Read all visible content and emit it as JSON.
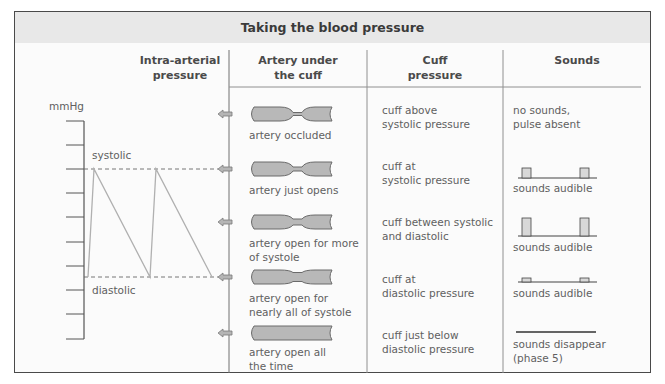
{
  "title": "Taking the blood pressure",
  "columns": {
    "intra_arterial": "Intra-arterial\npressure",
    "artery": "Artery under\nthe cuff",
    "cuff": "Cuff\npressure",
    "sounds": "Sounds"
  },
  "axis": {
    "unit": "mmHg",
    "systolic_label": "systolic",
    "diastolic_label": "diastolic"
  },
  "rows": [
    {
      "artery": "artery occluded",
      "cuff": "cuff above\nsystolic pressure",
      "sounds": "no sounds,\npulse absent",
      "sound_bar": "none"
    },
    {
      "artery": "artery just opens",
      "cuff": "cuff at\nsystolic pressure",
      "sounds": "sounds audible",
      "sound_bar": "small"
    },
    {
      "artery": "artery open for more\nof systole",
      "cuff": "cuff between systolic\nand diastolic",
      "sounds": "sounds audible",
      "sound_bar": "tall"
    },
    {
      "artery": "artery open for\nnearly all of systole",
      "cuff": "cuff at\ndiastolic pressure",
      "sounds": "sounds audible",
      "sound_bar": "tiny"
    },
    {
      "artery": "artery open all\nthe time",
      "cuff": "cuff just below\ndiastolic pressure",
      "sounds": "sounds disappear\n(phase 5)",
      "sound_bar": "line"
    }
  ],
  "colors": {
    "header_band": "#e8e8e8",
    "artery_fill": "#b8b8b8",
    "waveform": "#b0b0b0",
    "border": "#4a4a4a"
  }
}
